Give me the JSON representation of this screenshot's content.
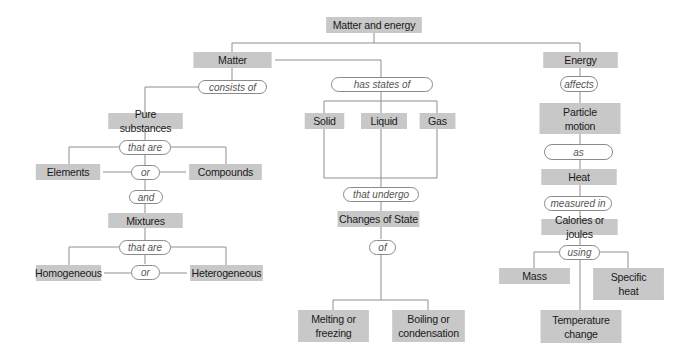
{
  "title": "Matter and energy",
  "nodes": {
    "root": "Matter and energy",
    "matter": "Matter",
    "energy": "Energy",
    "pure_substances": "Pure substances",
    "elements": "Elements",
    "compounds": "Compounds",
    "mixtures": "Mixtures",
    "homogeneous": "Homogeneous",
    "heterogeneous": "Heterogeneous",
    "solid": "Solid",
    "liquid": "Liquid",
    "gas": "Gas",
    "changes_of_state": "Changes of State",
    "melting": "Melting or freezing",
    "boiling": "Boiling or condensation",
    "particle_motion": "Particle motion",
    "heat": "Heat",
    "calories": "Calories or joules",
    "mass": "Mass",
    "specific_heat": "Specific heat",
    "temperature_change": "Temperature change"
  },
  "links": {
    "consists_of": "consists of",
    "that_are_1": "that are",
    "or_1": "or",
    "and": "and",
    "that_are_2": "that are",
    "or_2": "or",
    "has_states_of": "has states of",
    "that_undergo": "that undergo",
    "of": "of",
    "affects": "affects",
    "as": "as",
    "measured_in": "measured in",
    "using": "using"
  },
  "colors": {
    "box": "#c8c8c8",
    "line": "#8a8a8a",
    "pill_border": "#8a8a8a"
  }
}
